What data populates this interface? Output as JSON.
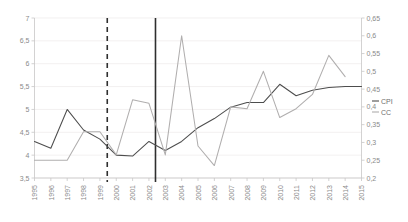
{
  "chart_data": {
    "type": "line",
    "title": "",
    "xlabel": "",
    "ylabel": "",
    "grid": true,
    "legend_position": "right",
    "categories": [
      "1995",
      "1996",
      "1997",
      "1998",
      "1999",
      "2000",
      "2001",
      "2002",
      "2003",
      "2004",
      "2005",
      "2006",
      "2007",
      "2008",
      "2009",
      "2010",
      "2011",
      "2012",
      "2013",
      "2014",
      "2015"
    ],
    "axes": {
      "left": {
        "label": "CPI",
        "min": 3.5,
        "max": 7,
        "step": 0.5,
        "ticks": [
          "3,5",
          "4",
          "4,5",
          "5",
          "5,5",
          "6",
          "6,5",
          "7"
        ],
        "tick_values": [
          3.5,
          4,
          4.5,
          5,
          5.5,
          6,
          6.5,
          7
        ]
      },
      "right": {
        "label": "CC",
        "min": 0.2,
        "max": 0.65,
        "step": 0.05,
        "ticks": [
          "0,2",
          "0,25",
          "0,3",
          "0,35",
          "0,4",
          "0,45",
          "0,5",
          "0,55",
          "0,6",
          "0,65"
        ],
        "tick_values": [
          0.2,
          0.25,
          0.3,
          0.35,
          0.4,
          0.45,
          0.5,
          0.55,
          0.6,
          0.65
        ]
      }
    },
    "series": [
      {
        "name": "CPI",
        "axis": "left",
        "color": "#4d4d4d",
        "values": [
          4.3,
          4.15,
          5.0,
          4.55,
          4.35,
          4.0,
          3.98,
          4.3,
          4.1,
          4.3,
          4.6,
          4.8,
          5.05,
          5.15,
          5.15,
          5.55,
          5.3,
          5.42,
          5.48,
          5.5,
          5.5
        ]
      },
      {
        "name": "CC",
        "axis": "right",
        "color": "#b0aeae",
        "values": [
          0.25,
          0.25,
          0.25,
          0.33,
          0.33,
          0.265,
          0.42,
          0.41,
          0.265,
          0.6,
          0.29,
          0.235,
          0.4,
          0.395,
          0.5,
          0.37,
          0.395,
          0.435,
          0.545,
          0.485,
          null
        ]
      }
    ],
    "annotations": [
      {
        "name": "dashed-vertical-line",
        "type": "vline",
        "style": "dashed",
        "x_category": "1999",
        "x_fraction": 4.45,
        "color": "#2f2f2f"
      },
      {
        "name": "solid-vertical-line",
        "type": "vline",
        "style": "solid",
        "x_category": "2002",
        "x_fraction": 7.4,
        "color": "#2f2f2f"
      }
    ],
    "legend": [
      {
        "name": "CPI",
        "color": "#4d4d4d"
      },
      {
        "name": "CC",
        "color": "#b0aeae"
      }
    ]
  }
}
